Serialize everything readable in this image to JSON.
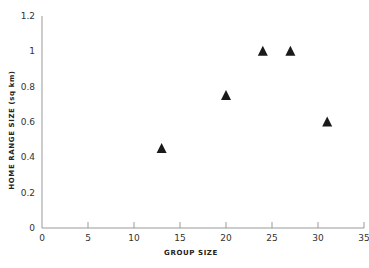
{
  "chart_data": {
    "type": "scatter",
    "title": "",
    "xlabel": "GROUP SIZE",
    "ylabel": "HOME RANGE SIZE (sq km)",
    "xlim": [
      0,
      35
    ],
    "ylim": [
      0,
      1.2
    ],
    "x_ticks": [
      0,
      5,
      10,
      15,
      20,
      25,
      30,
      35
    ],
    "y_ticks": [
      0,
      0.2,
      0.4,
      0.6,
      0.8,
      1,
      1.2
    ],
    "x_tick_labels": [
      "0",
      "5",
      "10",
      "15",
      "20",
      "25",
      "30",
      "35"
    ],
    "y_tick_labels": [
      "0",
      "0.2",
      "0.4",
      "0.6",
      "0.8",
      "1",
      "1.2"
    ],
    "grid": false,
    "legend": null,
    "marker": "triangle",
    "marker_color": "#1a1a1a",
    "series": [
      {
        "name": "Home range vs group size",
        "points": [
          {
            "x": 13,
            "y": 0.45
          },
          {
            "x": 20,
            "y": 0.75
          },
          {
            "x": 24,
            "y": 1.0
          },
          {
            "x": 27,
            "y": 1.0
          },
          {
            "x": 31,
            "y": 0.6
          }
        ]
      }
    ]
  },
  "colors": {
    "axis": "#999999",
    "marker": "#1a1a1a",
    "background": "#ffffff"
  }
}
